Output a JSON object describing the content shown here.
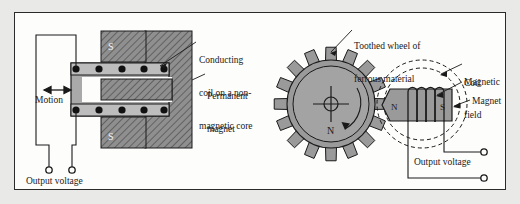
{
  "figure": {
    "background_color": "#e9e9e7",
    "plate_color": "#fdfdfc",
    "border_color": "#2b2b2b",
    "hatch_color": "#8c8c8c",
    "body_gray": "#9a9a9a",
    "core_gray": "#a7a7a7",
    "line_color": "#1a1a1a"
  },
  "left_diagram": {
    "name": "linear-variable-reluctance-sensor",
    "labels": {
      "coil": "Conducting\ncoil on a non-\nmagnetic core",
      "coil_line1": "Conducting",
      "coil_line2": "coil on a non-",
      "coil_line3": "magnetic core",
      "magnet": "Permanent\nmagnet",
      "magnet_line1": "Permanent",
      "magnet_line2": "magnet",
      "motion": "Motion",
      "output": "Output voltage"
    },
    "poles": [
      "S",
      "N",
      "S"
    ],
    "coil_dots_top": 5,
    "coil_dots_bottom": 5,
    "terminals": 2
  },
  "right_diagram": {
    "name": "toothed-wheel-speed-sensor",
    "labels": {
      "wheel_line1": "Toothed wheel of",
      "wheel_line2": "ferrous material",
      "field_line1": "Magnetic",
      "field_line2": "field",
      "coil": "Coil",
      "magnet": "Magnet",
      "output": "Output voltage"
    },
    "wheel": {
      "teeth": 16,
      "hub_label": "N",
      "rotation_arrow": true
    },
    "magnet_poles": [
      "N",
      "S"
    ],
    "coil_turns": 4,
    "field_loops": 2,
    "terminals": 2
  }
}
